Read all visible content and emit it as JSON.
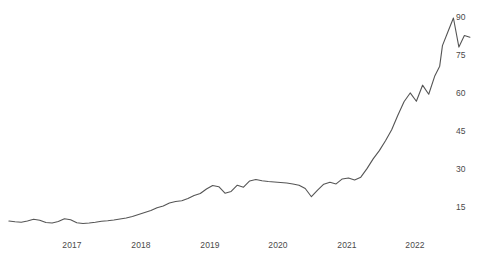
{
  "chart_data": {
    "type": "line",
    "title": "",
    "subtitle": "",
    "xlabel": "",
    "ylabel": "",
    "grid": false,
    "legend": false,
    "legend_position": "none",
    "line_color": "#555555",
    "background_color": "#ffffff",
    "tick_label_color": "#4a4a4a",
    "xlim": [
      2016.08,
      2022.36
    ],
    "ylim": [
      0,
      96
    ],
    "y_ticks": [
      15,
      30,
      45,
      60,
      75,
      90
    ],
    "y_tick_labels": [
      "15",
      "30",
      "45",
      "60",
      "75",
      "90"
    ],
    "x_ticks": [
      2017,
      2018,
      2019,
      2020,
      2021,
      2022
    ],
    "x_tick_labels": [
      "2017",
      "2018",
      "2019",
      "2020",
      "2021",
      "2022"
    ],
    "series": [
      {
        "name": "series-1",
        "x": [
          2016.08,
          2016.17,
          2016.26,
          2016.35,
          2016.44,
          2016.53,
          2016.62,
          2016.71,
          2016.8,
          2016.89,
          2016.98,
          2017.07,
          2017.16,
          2017.25,
          2017.34,
          2017.43,
          2017.52,
          2017.61,
          2017.7,
          2017.79,
          2017.88,
          2017.97,
          2018.06,
          2018.15,
          2018.24,
          2018.33,
          2018.42,
          2018.51,
          2018.6,
          2018.69,
          2018.78,
          2018.87,
          2018.96,
          2019.05,
          2019.14,
          2019.23,
          2019.32,
          2019.41,
          2019.5,
          2019.59,
          2019.68,
          2019.77,
          2019.86,
          2019.95,
          2020.04,
          2020.13,
          2020.22,
          2020.31,
          2020.4,
          2020.49,
          2020.58,
          2020.67,
          2020.76,
          2020.85,
          2020.94,
          2021.03,
          2021.12,
          2021.21,
          2021.3,
          2021.39,
          2021.48,
          2021.57,
          2021.66,
          2021.75,
          2021.84,
          2021.93,
          2022.02,
          2022.11,
          2022.2,
          2022.29,
          2022.36
        ],
        "values": [
          8.6,
          8.3,
          8.1,
          8.6,
          9.3,
          8.9,
          8.0,
          7.8,
          8.4,
          9.5,
          9.1,
          7.9,
          7.6,
          7.8,
          8.1,
          8.5,
          8.7,
          9.0,
          9.4,
          9.8,
          10.4,
          11.2,
          12.0,
          12.8,
          13.9,
          14.6,
          15.8,
          16.4,
          16.7,
          17.6,
          18.8,
          19.6,
          21.4,
          22.8,
          22.3,
          19.7,
          20.4,
          22.9,
          22.1,
          24.6,
          25.2,
          24.7,
          24.4,
          24.2,
          24.0,
          23.8,
          23.4,
          22.9,
          21.6,
          18.3,
          20.9,
          23.3,
          24.1,
          23.4,
          25.4,
          25.8,
          25.0,
          26.1,
          29.5,
          33.4,
          36.7,
          40.6,
          45.0,
          50.8,
          56.2,
          59.7,
          56.4,
          62.8,
          59.2,
          66.6,
          70.4
        ]
      }
    ],
    "series_tail": {
      "x": [
        2022.4,
        2022.48,
        2022.56,
        2022.64,
        2022.72,
        2022.8
      ],
      "values": [
        78.6,
        84.1,
        89.6,
        78.0,
        82.6,
        81.9
      ]
    },
    "annotations": [],
    "data_points_note": "Monthly series rising from roughly 8 in 2016 to a peak near 90 in mid-2022."
  },
  "axes": {
    "y_labels": [
      {
        "text": "90",
        "top": 12
      },
      {
        "text": "75",
        "top": 50
      },
      {
        "text": "60",
        "top": 88
      },
      {
        "text": "45",
        "top": 126
      },
      {
        "text": "30",
        "top": 164
      },
      {
        "text": "15",
        "top": 202
      }
    ],
    "x_labels": [
      {
        "text": "2017",
        "left": 72
      },
      {
        "text": "2018",
        "left": 141
      },
      {
        "text": "2019",
        "left": 210
      },
      {
        "text": "2020",
        "left": 278
      },
      {
        "text": "2021",
        "left": 347
      },
      {
        "text": "2022",
        "left": 415
      }
    ]
  }
}
